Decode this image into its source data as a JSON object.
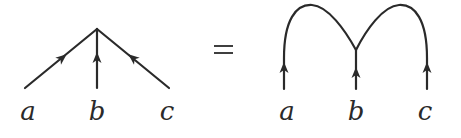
{
  "diagram": {
    "stroke_color": "#2a2a2a",
    "equation_symbol": "=",
    "left": {
      "type": "trivalent-vertex",
      "labels": [
        "a",
        "b",
        "c"
      ],
      "edges": [
        "a-to-vertex",
        "b-to-vertex",
        "c-to-vertex"
      ],
      "arrow_direction": "toward-vertex"
    },
    "right": {
      "type": "double-arc-junction",
      "labels": [
        "a",
        "b",
        "c"
      ],
      "arrow_direction": "upward"
    }
  }
}
